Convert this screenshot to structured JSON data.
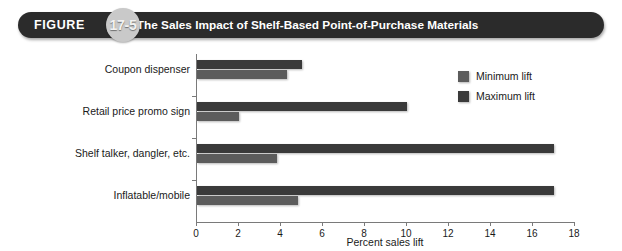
{
  "header": {
    "figure_word": "FIGURE",
    "figure_number": "17-5",
    "title": "The Sales Impact of Shelf-Based Point-of-Purchase Materials",
    "bar_color": "#2b2b2b",
    "badge_color": "#c9c9c9"
  },
  "legend": {
    "position": "top-right",
    "items": [
      {
        "label": "Minimum lift",
        "color": "#5c5c5c"
      },
      {
        "label": "Maximum lift",
        "color": "#3a3a3a"
      }
    ]
  },
  "chart_data": {
    "type": "bar",
    "orientation": "horizontal",
    "title": "The Sales Impact of Shelf-Based Point-of-Purchase Materials",
    "xlabel": "Percent sales lift",
    "ylabel": "",
    "xlim": [
      0,
      18
    ],
    "xticks": [
      0,
      2,
      4,
      6,
      8,
      10,
      12,
      14,
      16,
      18
    ],
    "xtick_labels": [
      "0",
      "2",
      "4",
      "6",
      "8",
      "10",
      "12",
      "14",
      "16",
      "18"
    ],
    "grid": false,
    "categories": [
      "Coupon dispenser",
      "Retail price promo sign",
      "Shelf talker, dangler, etc.",
      "Inflatable/mobile"
    ],
    "series": [
      {
        "name": "Maximum lift",
        "color": "#3a3a3a",
        "values": [
          5.0,
          10.0,
          17.0,
          17.0
        ]
      },
      {
        "name": "Minimum lift",
        "color": "#5c5c5c",
        "values": [
          4.3,
          2.0,
          3.8,
          4.8
        ]
      }
    ]
  }
}
